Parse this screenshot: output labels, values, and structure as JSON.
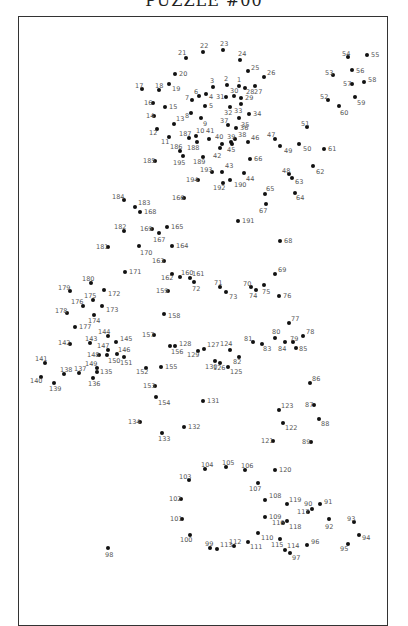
{
  "page": {
    "title": "PUZZLE #00"
  },
  "dots": [
    {
      "n": "1",
      "x": 239,
      "y": 86,
      "lx": 237,
      "ly": 77
    },
    {
      "n": "2",
      "x": 227,
      "y": 85,
      "lx": 224,
      "ly": 76
    },
    {
      "n": "3",
      "x": 213,
      "y": 87,
      "lx": 210,
      "ly": 78
    },
    {
      "n": "4",
      "x": 206,
      "y": 94,
      "lx": 209,
      "ly": 94
    },
    {
      "n": "5",
      "x": 205,
      "y": 106,
      "lx": 209,
      "ly": 103
    },
    {
      "n": "6",
      "x": 199,
      "y": 96,
      "lx": 194,
      "ly": 89
    },
    {
      "n": "7",
      "x": 192,
      "y": 100,
      "lx": 185,
      "ly": 95
    },
    {
      "n": "8",
      "x": 191,
      "y": 113,
      "lx": 185,
      "ly": 113
    },
    {
      "n": "9",
      "x": 201,
      "y": 118,
      "lx": 203,
      "ly": 121
    },
    {
      "n": "10",
      "x": 196,
      "y": 136,
      "lx": 196,
      "ly": 128
    },
    {
      "n": "11",
      "x": 169,
      "y": 137,
      "lx": 161,
      "ly": 139
    },
    {
      "n": "12",
      "x": 157,
      "y": 129,
      "lx": 149,
      "ly": 130
    },
    {
      "n": "13",
      "x": 174,
      "y": 124,
      "lx": 176,
      "ly": 116
    },
    {
      "n": "14",
      "x": 154,
      "y": 116,
      "lx": 146,
      "ly": 113
    },
    {
      "n": "15",
      "x": 165,
      "y": 107,
      "lx": 169,
      "ly": 104
    },
    {
      "n": "16",
      "x": 153,
      "y": 103,
      "lx": 144,
      "ly": 100
    },
    {
      "n": "17",
      "x": 142,
      "y": 89,
      "lx": 135,
      "ly": 83
    },
    {
      "n": "18",
      "x": 159,
      "y": 90,
      "lx": 155,
      "ly": 83
    },
    {
      "n": "19",
      "x": 169,
      "y": 84,
      "lx": 172,
      "ly": 86
    },
    {
      "n": "20",
      "x": 175,
      "y": 74,
      "lx": 179,
      "ly": 71
    },
    {
      "n": "21",
      "x": 186,
      "y": 58,
      "lx": 178,
      "ly": 50
    },
    {
      "n": "22",
      "x": 203,
      "y": 52,
      "lx": 200,
      "ly": 43
    },
    {
      "n": "23",
      "x": 223,
      "y": 50,
      "lx": 220,
      "ly": 41
    },
    {
      "n": "24",
      "x": 240,
      "y": 60,
      "lx": 238,
      "ly": 51
    },
    {
      "n": "25",
      "x": 248,
      "y": 71,
      "lx": 251,
      "ly": 65
    },
    {
      "n": "26",
      "x": 264,
      "y": 77,
      "lx": 267,
      "ly": 70
    },
    {
      "n": "27",
      "x": 255,
      "y": 86,
      "lx": 254,
      "ly": 89
    },
    {
      "n": "28",
      "x": 245,
      "y": 88,
      "lx": 246,
      "ly": 89
    },
    {
      "n": "29",
      "x": 241,
      "y": 98,
      "lx": 245,
      "ly": 95
    },
    {
      "n": "30",
      "x": 234,
      "y": 96,
      "lx": 230,
      "ly": 88
    },
    {
      "n": "31",
      "x": 226,
      "y": 97,
      "lx": 216,
      "ly": 94
    },
    {
      "n": "32",
      "x": 230,
      "y": 107,
      "lx": 224,
      "ly": 110
    },
    {
      "n": "33",
      "x": 241,
      "y": 104,
      "lx": 234,
      "ly": 108
    },
    {
      "n": "34",
      "x": 249,
      "y": 114,
      "lx": 253,
      "ly": 111
    },
    {
      "n": "35",
      "x": 239,
      "y": 118,
      "lx": 241,
      "ly": 122
    },
    {
      "n": "36",
      "x": 236,
      "y": 128,
      "lx": 240,
      "ly": 125
    },
    {
      "n": "37",
      "x": 228,
      "y": 125,
      "lx": 220,
      "ly": 118
    },
    {
      "n": "38",
      "x": 235,
      "y": 139,
      "lx": 238,
      "ly": 132
    },
    {
      "n": "39",
      "x": 231,
      "y": 142,
      "lx": 227,
      "ly": 134
    },
    {
      "n": "40",
      "x": 222,
      "y": 144,
      "lx": 215,
      "ly": 134
    },
    {
      "n": "41",
      "x": 209,
      "y": 139,
      "lx": 206,
      "ly": 128
    },
    {
      "n": "42",
      "x": 220,
      "y": 148,
      "lx": 213,
      "ly": 153
    },
    {
      "n": "43",
      "x": 222,
      "y": 172,
      "lx": 225,
      "ly": 163
    },
    {
      "n": "44",
      "x": 244,
      "y": 173,
      "lx": 246,
      "ly": 176
    },
    {
      "n": "45",
      "x": 232,
      "y": 144,
      "lx": 227,
      "ly": 147
    },
    {
      "n": "46",
      "x": 248,
      "y": 142,
      "lx": 251,
      "ly": 135
    },
    {
      "n": "47",
      "x": 275,
      "y": 139,
      "lx": 267,
      "ly": 132
    },
    {
      "n": "48",
      "x": 289,
      "y": 174,
      "lx": 282,
      "ly": 168
    },
    {
      "n": "49",
      "x": 280,
      "y": 146,
      "lx": 284,
      "ly": 148
    },
    {
      "n": "50",
      "x": 299,
      "y": 144,
      "lx": 303,
      "ly": 146
    },
    {
      "n": "51",
      "x": 307,
      "y": 127,
      "lx": 301,
      "ly": 121
    },
    {
      "n": "52",
      "x": 328,
      "y": 100,
      "lx": 320,
      "ly": 94
    },
    {
      "n": "53",
      "x": 333,
      "y": 75,
      "lx": 325,
      "ly": 70
    },
    {
      "n": "54",
      "x": 348,
      "y": 57,
      "lx": 342,
      "ly": 51
    },
    {
      "n": "55",
      "x": 367,
      "y": 55,
      "lx": 371,
      "ly": 52
    },
    {
      "n": "56",
      "x": 352,
      "y": 70,
      "lx": 356,
      "ly": 68
    },
    {
      "n": "57",
      "x": 352,
      "y": 84,
      "lx": 343,
      "ly": 81
    },
    {
      "n": "58",
      "x": 364,
      "y": 82,
      "lx": 368,
      "ly": 77
    },
    {
      "n": "59",
      "x": 355,
      "y": 97,
      "lx": 357,
      "ly": 100
    },
    {
      "n": "60",
      "x": 339,
      "y": 106,
      "lx": 340,
      "ly": 110
    },
    {
      "n": "61",
      "x": 324,
      "y": 149,
      "lx": 328,
      "ly": 146
    },
    {
      "n": "62",
      "x": 313,
      "y": 166,
      "lx": 316,
      "ly": 169
    },
    {
      "n": "63",
      "x": 292,
      "y": 178,
      "lx": 295,
      "ly": 179
    },
    {
      "n": "64",
      "x": 295,
      "y": 193,
      "lx": 296,
      "ly": 195
    },
    {
      "n": "65",
      "x": 265,
      "y": 194,
      "lx": 266,
      "ly": 186
    },
    {
      "n": "66",
      "x": 250,
      "y": 159,
      "lx": 254,
      "ly": 156
    },
    {
      "n": "67",
      "x": 266,
      "y": 204,
      "lx": 259,
      "ly": 208
    },
    {
      "n": "68",
      "x": 280,
      "y": 241,
      "lx": 284,
      "ly": 238
    },
    {
      "n": "69",
      "x": 275,
      "y": 274,
      "lx": 278,
      "ly": 267
    },
    {
      "n": "70",
      "x": 251,
      "y": 287,
      "lx": 243,
      "ly": 281
    },
    {
      "n": "71",
      "x": 220,
      "y": 287,
      "lx": 214,
      "ly": 280
    },
    {
      "n": "72",
      "x": 194,
      "y": 282,
      "lx": 192,
      "ly": 286
    },
    {
      "n": "73",
      "x": 226,
      "y": 292,
      "lx": 229,
      "ly": 294
    },
    {
      "n": "74",
      "x": 256,
      "y": 290,
      "lx": 249,
      "ly": 293
    },
    {
      "n": "75",
      "x": 264,
      "y": 285,
      "lx": 262,
      "ly": 289
    },
    {
      "n": "76",
      "x": 279,
      "y": 296,
      "lx": 283,
      "ly": 293
    },
    {
      "n": "77",
      "x": 289,
      "y": 323,
      "lx": 291,
      "ly": 316
    },
    {
      "n": "78",
      "x": 303,
      "y": 336,
      "lx": 306,
      "ly": 329
    },
    {
      "n": "79",
      "x": 293,
      "y": 342,
      "lx": 290,
      "ly": 336
    },
    {
      "n": "80",
      "x": 275,
      "y": 338,
      "lx": 272,
      "ly": 329
    },
    {
      "n": "81",
      "x": 253,
      "y": 342,
      "lx": 244,
      "ly": 336
    },
    {
      "n": "82",
      "x": 239,
      "y": 357,
      "lx": 233,
      "ly": 359
    },
    {
      "n": "83",
      "x": 262,
      "y": 344,
      "lx": 263,
      "ly": 346
    },
    {
      "n": "84",
      "x": 285,
      "y": 342,
      "lx": 278,
      "ly": 346
    },
    {
      "n": "85",
      "x": 296,
      "y": 348,
      "lx": 299,
      "ly": 346
    },
    {
      "n": "86",
      "x": 310,
      "y": 383,
      "lx": 312,
      "ly": 376
    },
    {
      "n": "87",
      "x": 314,
      "y": 405,
      "lx": 305,
      "ly": 402
    },
    {
      "n": "88",
      "x": 319,
      "y": 419,
      "lx": 321,
      "ly": 421
    },
    {
      "n": "89",
      "x": 311,
      "y": 442,
      "lx": 302,
      "ly": 439
    },
    {
      "n": "90",
      "x": 312,
      "y": 509,
      "lx": 304,
      "ly": 501
    },
    {
      "n": "91",
      "x": 320,
      "y": 504,
      "lx": 324,
      "ly": 499
    },
    {
      "n": "92",
      "x": 329,
      "y": 519,
      "lx": 325,
      "ly": 524
    },
    {
      "n": "93",
      "x": 354,
      "y": 522,
      "lx": 347,
      "ly": 516
    },
    {
      "n": "94",
      "x": 359,
      "y": 535,
      "lx": 362,
      "ly": 535
    },
    {
      "n": "95",
      "x": 348,
      "y": 544,
      "lx": 340,
      "ly": 546
    },
    {
      "n": "96",
      "x": 307,
      "y": 545,
      "lx": 311,
      "ly": 539
    },
    {
      "n": "97",
      "x": 290,
      "y": 553,
      "lx": 292,
      "ly": 555
    },
    {
      "n": "98",
      "x": 108,
      "y": 548,
      "lx": 105,
      "ly": 552
    },
    {
      "n": "99",
      "x": 210,
      "y": 548,
      "lx": 205,
      "ly": 541
    },
    {
      "n": "100",
      "x": 190,
      "y": 535,
      "lx": 180,
      "ly": 537
    },
    {
      "n": "101",
      "x": 182,
      "y": 519,
      "lx": 170,
      "ly": 516
    },
    {
      "n": "102",
      "x": 181,
      "y": 499,
      "lx": 169,
      "ly": 496
    },
    {
      "n": "103",
      "x": 189,
      "y": 480,
      "lx": 179,
      "ly": 474
    },
    {
      "n": "104",
      "x": 205,
      "y": 469,
      "lx": 201,
      "ly": 462
    },
    {
      "n": "105",
      "x": 226,
      "y": 467,
      "lx": 222,
      "ly": 460
    },
    {
      "n": "106",
      "x": 245,
      "y": 470,
      "lx": 241,
      "ly": 463
    },
    {
      "n": "107",
      "x": 258,
      "y": 483,
      "lx": 249,
      "ly": 486
    },
    {
      "n": "108",
      "x": 265,
      "y": 500,
      "lx": 269,
      "ly": 493
    },
    {
      "n": "109",
      "x": 265,
      "y": 517,
      "lx": 269,
      "ly": 514
    },
    {
      "n": "110",
      "x": 258,
      "y": 533,
      "lx": 261,
      "ly": 535
    },
    {
      "n": "111",
      "x": 248,
      "y": 542,
      "lx": 250,
      "ly": 544
    },
    {
      "n": "112",
      "x": 234,
      "y": 546,
      "lx": 229,
      "ly": 539
    },
    {
      "n": "113",
      "x": 217,
      "y": 549,
      "lx": 220,
      "ly": 542
    },
    {
      "n": "114",
      "x": 285,
      "y": 550,
      "lx": 287,
      "ly": 543
    },
    {
      "n": "115",
      "x": 280,
      "y": 539,
      "lx": 271,
      "ly": 542
    },
    {
      "n": "116",
      "x": 283,
      "y": 523,
      "lx": 272,
      "ly": 520
    },
    {
      "n": "117",
      "x": 308,
      "y": 512,
      "lx": 297,
      "ly": 509
    },
    {
      "n": "118",
      "x": 287,
      "y": 521,
      "lx": 289,
      "ly": 524
    },
    {
      "n": "119",
      "x": 287,
      "y": 504,
      "lx": 289,
      "ly": 497
    },
    {
      "n": "120",
      "x": 275,
      "y": 470,
      "lx": 279,
      "ly": 467
    },
    {
      "n": "121",
      "x": 273,
      "y": 441,
      "lx": 261,
      "ly": 438
    },
    {
      "n": "122",
      "x": 283,
      "y": 423,
      "lx": 285,
      "ly": 425
    },
    {
      "n": "123",
      "x": 279,
      "y": 410,
      "lx": 281,
      "ly": 403
    },
    {
      "n": "124",
      "x": 230,
      "y": 350,
      "lx": 220,
      "ly": 341
    },
    {
      "n": "125",
      "x": 228,
      "y": 367,
      "lx": 230,
      "ly": 369
    },
    {
      "n": "126",
      "x": 220,
      "y": 363,
      "lx": 213,
      "ly": 365
    },
    {
      "n": "127",
      "x": 204,
      "y": 349,
      "lx": 207,
      "ly": 342
    },
    {
      "n": "128",
      "x": 175,
      "y": 346,
      "lx": 179,
      "ly": 341
    },
    {
      "n": "129",
      "x": 198,
      "y": 351,
      "lx": 187,
      "ly": 352
    },
    {
      "n": "130",
      "x": 215,
      "y": 361,
      "lx": 205,
      "ly": 364
    },
    {
      "n": "131",
      "x": 203,
      "y": 401,
      "lx": 207,
      "ly": 398
    },
    {
      "n": "132",
      "x": 184,
      "y": 427,
      "lx": 188,
      "ly": 424
    },
    {
      "n": "133",
      "x": 162,
      "y": 433,
      "lx": 158,
      "ly": 436
    },
    {
      "n": "134",
      "x": 140,
      "y": 422,
      "lx": 128,
      "ly": 419
    },
    {
      "n": "135",
      "x": 97,
      "y": 372,
      "lx": 100,
      "ly": 369
    },
    {
      "n": "136",
      "x": 93,
      "y": 378,
      "lx": 88,
      "ly": 381
    },
    {
      "n": "137",
      "x": 79,
      "y": 373,
      "lx": 74,
      "ly": 366
    },
    {
      "n": "138",
      "x": 64,
      "y": 374,
      "lx": 60,
      "ly": 367
    },
    {
      "n": "139",
      "x": 54,
      "y": 383,
      "lx": 49,
      "ly": 386
    },
    {
      "n": "140",
      "x": 41,
      "y": 377,
      "lx": 30,
      "ly": 378
    },
    {
      "n": "141",
      "x": 45,
      "y": 363,
      "lx": 35,
      "ly": 356
    },
    {
      "n": "142",
      "x": 70,
      "y": 344,
      "lx": 58,
      "ly": 340
    },
    {
      "n": "143",
      "x": 90,
      "y": 343,
      "lx": 85,
      "ly": 336
    },
    {
      "n": "144",
      "x": 108,
      "y": 336,
      "lx": 98,
      "ly": 329
    },
    {
      "n": "145",
      "x": 116,
      "y": 342,
      "lx": 120,
      "ly": 336
    },
    {
      "n": "146",
      "x": 117,
      "y": 354,
      "lx": 118,
      "ly": 347
    },
    {
      "n": "147",
      "x": 108,
      "y": 350,
      "lx": 97,
      "ly": 343
    },
    {
      "n": "148",
      "x": 99,
      "y": 355,
      "lx": 87,
      "ly": 352
    },
    {
      "n": "149",
      "x": 97,
      "y": 368,
      "lx": 85,
      "ly": 361
    },
    {
      "n": "150",
      "x": 107,
      "y": 355,
      "lx": 108,
      "ly": 358
    },
    {
      "n": "151",
      "x": 124,
      "y": 357,
      "lx": 120,
      "ly": 360
    },
    {
      "n": "152",
      "x": 146,
      "y": 368,
      "lx": 136,
      "ly": 369
    },
    {
      "n": "153",
      "x": 155,
      "y": 386,
      "lx": 143,
      "ly": 383
    },
    {
      "n": "154",
      "x": 156,
      "y": 397,
      "lx": 158,
      "ly": 400
    },
    {
      "n": "155",
      "x": 161,
      "y": 367,
      "lx": 165,
      "ly": 364
    },
    {
      "n": "156",
      "x": 170,
      "y": 346,
      "lx": 171,
      "ly": 349
    },
    {
      "n": "157",
      "x": 154,
      "y": 335,
      "lx": 142,
      "ly": 332
    },
    {
      "n": "158",
      "x": 164,
      "y": 314,
      "lx": 168,
      "ly": 313
    },
    {
      "n": "159",
      "x": 168,
      "y": 291,
      "lx": 156,
      "ly": 288
    },
    {
      "n": "160",
      "x": 180,
      "y": 277,
      "lx": 181,
      "ly": 270
    },
    {
      "n": "161",
      "x": 190,
      "y": 278,
      "lx": 192,
      "ly": 271
    },
    {
      "n": "162",
      "x": 172,
      "y": 274,
      "lx": 161,
      "ly": 275
    },
    {
      "n": "163",
      "x": 164,
      "y": 261,
      "lx": 152,
      "ly": 258
    },
    {
      "n": "164",
      "x": 172,
      "y": 246,
      "lx": 176,
      "ly": 243
    },
    {
      "n": "165",
      "x": 167,
      "y": 227,
      "lx": 171,
      "ly": 224
    },
    {
      "n": "166",
      "x": 184,
      "y": 198,
      "lx": 172,
      "ly": 195
    },
    {
      "n": "167",
      "x": 159,
      "y": 233,
      "lx": 153,
      "ly": 237
    },
    {
      "n": "168",
      "x": 140,
      "y": 212,
      "lx": 144,
      "ly": 209
    },
    {
      "n": "169",
      "x": 152,
      "y": 229,
      "lx": 140,
      "ly": 226
    },
    {
      "n": "170",
      "x": 139,
      "y": 246,
      "lx": 140,
      "ly": 250
    },
    {
      "n": "171",
      "x": 125,
      "y": 272,
      "lx": 129,
      "ly": 269
    },
    {
      "n": "172",
      "x": 104,
      "y": 290,
      "lx": 108,
      "ly": 291
    },
    {
      "n": "173",
      "x": 102,
      "y": 306,
      "lx": 106,
      "ly": 307
    },
    {
      "n": "174",
      "x": 94,
      "y": 315,
      "lx": 88,
      "ly": 318
    },
    {
      "n": "175",
      "x": 93,
      "y": 300,
      "lx": 84,
      "ly": 293
    },
    {
      "n": "176",
      "x": 83,
      "y": 306,
      "lx": 71,
      "ly": 299
    },
    {
      "n": "177",
      "x": 75,
      "y": 327,
      "lx": 79,
      "ly": 324
    },
    {
      "n": "178",
      "x": 67,
      "y": 313,
      "lx": 55,
      "ly": 308
    },
    {
      "n": "179",
      "x": 70,
      "y": 291,
      "lx": 58,
      "ly": 285
    },
    {
      "n": "180",
      "x": 91,
      "y": 283,
      "lx": 82,
      "ly": 276
    },
    {
      "n": "181",
      "x": 108,
      "y": 247,
      "lx": 96,
      "ly": 244
    },
    {
      "n": "182",
      "x": 124,
      "y": 231,
      "lx": 114,
      "ly": 224
    },
    {
      "n": "183",
      "x": 135,
      "y": 207,
      "lx": 138,
      "ly": 200
    },
    {
      "n": "184",
      "x": 124,
      "y": 200,
      "lx": 112,
      "ly": 194
    },
    {
      "n": "185",
      "x": 155,
      "y": 161,
      "lx": 143,
      "ly": 158
    },
    {
      "n": "186",
      "x": 180,
      "y": 151,
      "lx": 170,
      "ly": 144
    },
    {
      "n": "187",
      "x": 189,
      "y": 138,
      "lx": 179,
      "ly": 131
    },
    {
      "n": "188",
      "x": 197,
      "y": 142,
      "lx": 187,
      "ly": 145
    },
    {
      "n": "189",
      "x": 203,
      "y": 157,
      "lx": 193,
      "ly": 159
    },
    {
      "n": "190",
      "x": 230,
      "y": 180,
      "lx": 234,
      "ly": 182
    },
    {
      "n": "191",
      "x": 238,
      "y": 221,
      "lx": 242,
      "ly": 218
    },
    {
      "n": "192",
      "x": 223,
      "y": 183,
      "lx": 213,
      "ly": 185
    },
    {
      "n": "193",
      "x": 212,
      "y": 172,
      "lx": 200,
      "ly": 167
    },
    {
      "n": "194",
      "x": 198,
      "y": 180,
      "lx": 186,
      "ly": 177
    },
    {
      "n": "195",
      "x": 183,
      "y": 156,
      "lx": 173,
      "ly": 160
    }
  ]
}
